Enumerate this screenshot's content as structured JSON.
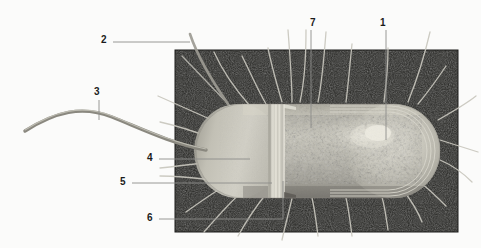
{
  "figure": {
    "background_color": "#fbfbfa",
    "plate_color": "#2a2a28",
    "cell_color": "#b9b7ad",
    "leader_line_color": "#8d8d8a",
    "label_color": "#1b1b1b",
    "flagellum_color": "#8f8d86"
  },
  "labels": [
    {
      "id": "1",
      "text": "1",
      "x": 383,
      "y": 23,
      "target": "nucleoid-region"
    },
    {
      "id": "2",
      "text": "2",
      "x": 104,
      "y": 40,
      "target": "pilus-upper-left"
    },
    {
      "id": "3",
      "text": "3",
      "x": 96,
      "y": 93,
      "target": "flagellum"
    },
    {
      "id": "4",
      "text": "4",
      "x": 150,
      "y": 157,
      "target": "cytoplasm"
    },
    {
      "id": "5",
      "text": "5",
      "x": 123,
      "y": 181,
      "target": "cell-wall-layers"
    },
    {
      "id": "6",
      "text": "6",
      "x": 150,
      "y": 217,
      "target": "plasma-membrane"
    },
    {
      "id": "7",
      "text": "7",
      "x": 314,
      "y": 23,
      "target": "cytoplasm-interior"
    }
  ],
  "structures": {
    "plate": {
      "x": 175,
      "y": 50,
      "width": 283,
      "height": 182
    },
    "cell_body": {
      "left": 196,
      "right": 440,
      "top": 104,
      "bottom": 198
    },
    "flagellum_label": "flagellum",
    "pili_label": "pili",
    "nucleoid_label": "nucleoid",
    "cut_away_label": "cut-away cross-section"
  }
}
